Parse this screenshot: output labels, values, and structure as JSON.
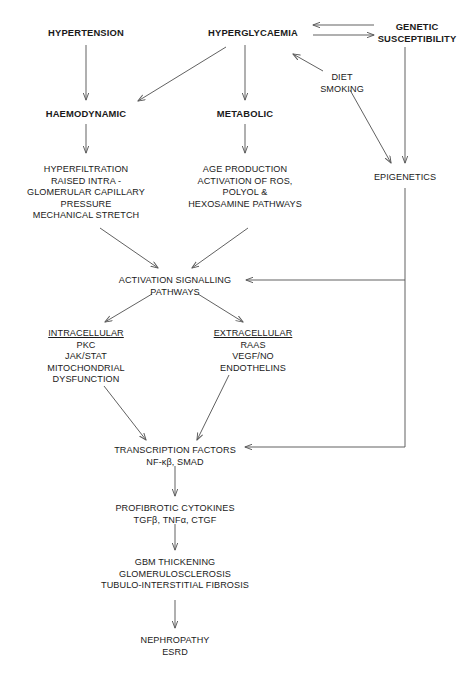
{
  "diagram": {
    "stroke_color": "#595959",
    "text_color": "#1a1a1a",
    "background": "#ffffff",
    "nodes": [
      {
        "id": "hypertension",
        "name": "hypertension",
        "bold": true,
        "cx": 86,
        "cy": 33,
        "lines": [
          "HYPERTENSION"
        ]
      },
      {
        "id": "hyperglycaemia",
        "name": "hyperglycaemia",
        "bold": true,
        "cx": 253,
        "cy": 33,
        "lines": [
          "HYPERGLYCAEMIA"
        ]
      },
      {
        "id": "genetic-susceptibility",
        "name": "genetic-susceptibility",
        "bold": true,
        "cx": 417,
        "cy": 27,
        "lines": [
          "GENETIC",
          "SUSCEPTIBILITY"
        ]
      },
      {
        "id": "diet-smoking",
        "name": "diet-smoking",
        "bold": false,
        "cx": 342,
        "cy": 78,
        "lines": [
          "DIET",
          "SMOKING"
        ]
      },
      {
        "id": "haemodynamic",
        "name": "haemodynamic",
        "bold": true,
        "cx": 86,
        "cy": 114,
        "lines": [
          "HAEMODYNAMIC"
        ]
      },
      {
        "id": "metabolic",
        "name": "metabolic",
        "bold": true,
        "cx": 245,
        "cy": 114,
        "lines": [
          "METABOLIC"
        ]
      },
      {
        "id": "epigenetics",
        "name": "epigenetics",
        "bold": false,
        "cx": 405,
        "cy": 178,
        "lines": [
          "EPIGENETICS"
        ]
      },
      {
        "id": "haemodynamic-detail",
        "name": "haemodynamic-mechanisms",
        "bold": false,
        "cx": 86,
        "cy": 170,
        "lines": [
          "HYPERFILTRATION",
          "RAISED INTRA -",
          "GLOMERULAR CAPILLARY",
          "PRESSURE",
          "MECHANICAL STRETCH"
        ]
      },
      {
        "id": "metabolic-detail",
        "name": "metabolic-mechanisms",
        "bold": false,
        "cx": 245,
        "cy": 170,
        "lines": [
          "AGE PRODUCTION",
          "ACTIVATION OF ROS,",
          "POLYOL &",
          "HEXOSAMINE PATHWAYS"
        ]
      },
      {
        "id": "activation-signalling",
        "name": "activation-signalling-pathways",
        "bold": false,
        "cx": 175,
        "cy": 281,
        "lines": [
          "ACTIVATION SIGNALLING",
          "PATHWAYS"
        ]
      },
      {
        "id": "intracellular",
        "name": "intracellular-pathways",
        "bold": false,
        "cx": 86,
        "cy": 334,
        "header": "INTRACELLULAR",
        "lines": [
          "PKC",
          "JAK/STAT",
          "MITOCHONDRIAL",
          "DYSFUNCTION"
        ]
      },
      {
        "id": "extracellular",
        "name": "extracellular-pathways",
        "bold": false,
        "cx": 253,
        "cy": 334,
        "header": "EXTRACELLULAR",
        "lines": [
          "RAAS",
          "VEGF/NO",
          "ENDOTHELINS"
        ]
      },
      {
        "id": "transcription-factors",
        "name": "transcription-factors",
        "bold": false,
        "cx": 175,
        "cy": 451,
        "lines": [
          "TRANSCRIPTION FACTORS",
          "NF-κβ, SMAD"
        ]
      },
      {
        "id": "profibrotic-cytokines",
        "name": "profibrotic-cytokines",
        "bold": false,
        "cx": 175,
        "cy": 509,
        "lines": [
          "PROFIBROTIC CYTOKINES",
          "TGFβ, TNFα, CTGF"
        ]
      },
      {
        "id": "structural-damage",
        "name": "structural-kidney-damage",
        "bold": false,
        "cx": 175,
        "cy": 563,
        "lines": [
          "GBM THICKENING",
          "GLOMERULOSCLEROSIS",
          "TUBULO-INTERSTITIAL FIBROSIS"
        ]
      },
      {
        "id": "nephropathy",
        "name": "nephropathy-esrd",
        "bold": false,
        "cx": 175,
        "cy": 641,
        "lines": [
          "NEPHROPATHY",
          "ESRD"
        ]
      }
    ],
    "connectors": [
      {
        "id": "c1",
        "name": "arrow-hypertension-to-haemodynamic",
        "path": "M 86 45 L 86 100",
        "arrow_end": true
      },
      {
        "id": "c2",
        "name": "arrow-hyperglycaemia-to-metabolic",
        "path": "M 245 45 L 245 100",
        "arrow_end": true
      },
      {
        "id": "c3",
        "name": "arrow-hyperglycaemia-to-haemodynamic",
        "path": "M 226 47 L 138 101",
        "arrow_end": true
      },
      {
        "id": "c4",
        "name": "arrow-genetic-to-hyperglycaemia",
        "path": "M 374 25 L 313 25",
        "arrow_end": true
      },
      {
        "id": "c5",
        "name": "arrow-hyperglycaemia-to-genetic",
        "path": "M 313 35 L 374 35",
        "arrow_end": true
      },
      {
        "id": "c6",
        "name": "arrow-diet-smoking-to-hyperglycaemia",
        "path": "M 323 71 L 293 54",
        "arrow_end": true
      },
      {
        "id": "c7",
        "name": "arrow-diet-smoking-to-epigenetics",
        "path": "M 350 90 L 391 163",
        "arrow_end": true
      },
      {
        "id": "c8",
        "name": "arrow-genetic-to-epigenetics",
        "path": "M 405 47 L 405 163",
        "arrow_end": true
      },
      {
        "id": "c9",
        "name": "arrow-haemodynamic-to-detail",
        "path": "M 86 124 L 86 153",
        "arrow_end": true
      },
      {
        "id": "c10",
        "name": "arrow-metabolic-to-detail",
        "path": "M 245 124 L 245 153",
        "arrow_end": true
      },
      {
        "id": "c11",
        "name": "arrow-haemodynamic-detail-to-signalling",
        "path": "M 100 228 L 158 268",
        "arrow_end": true
      },
      {
        "id": "c12",
        "name": "arrow-metabolic-detail-to-signalling",
        "path": "M 248 228 L 192 268",
        "arrow_end": true
      },
      {
        "id": "c13",
        "name": "line-epigenetics-to-signalling",
        "path": "M 405 188 L 405 280 L 246 280",
        "arrow_end": true
      },
      {
        "id": "c14",
        "name": "line-epigenetics-to-transcription-factors",
        "path": "M 405 280 L 405 447 L 245 447",
        "arrow_end": true
      },
      {
        "id": "c15",
        "name": "arrow-signalling-to-intracellular",
        "path": "M 152 294 L 105 322",
        "arrow_end": true
      },
      {
        "id": "c16",
        "name": "arrow-signalling-to-extracellular",
        "path": "M 198 294 L 243 322",
        "arrow_end": true
      },
      {
        "id": "c17",
        "name": "arrow-intracellular-to-transcription-factors",
        "path": "M 104 386 L 146 440",
        "arrow_end": true
      },
      {
        "id": "c18",
        "name": "arrow-extracellular-to-transcription-factors",
        "path": "M 229 375 L 197 440",
        "arrow_end": true
      },
      {
        "id": "c19",
        "name": "arrow-transcription-to-cytokines",
        "path": "M 175 466 L 175 496",
        "arrow_end": true
      },
      {
        "id": "c20",
        "name": "arrow-cytokines-to-structural-damage",
        "path": "M 175 524 L 175 550",
        "arrow_end": true
      },
      {
        "id": "c21",
        "name": "arrow-structural-damage-to-nephropathy",
        "path": "M 175 600 L 175 628",
        "arrow_end": true
      }
    ]
  }
}
